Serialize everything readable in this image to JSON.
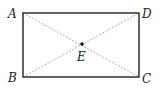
{
  "diagram": {
    "type": "rectangle-with-diagonals",
    "points": {
      "A": {
        "label": "A",
        "x": 23,
        "y": 13
      },
      "B": {
        "label": "B",
        "x": 23,
        "y": 77
      },
      "C": {
        "label": "C",
        "x": 139,
        "y": 77
      },
      "D": {
        "label": "D",
        "x": 139,
        "y": 13
      },
      "E": {
        "label": "E",
        "x": 82,
        "y": 44
      }
    },
    "edges": [
      [
        "A",
        "B"
      ],
      [
        "B",
        "C"
      ],
      [
        "C",
        "D"
      ],
      [
        "D",
        "A"
      ]
    ],
    "diagonals": [
      [
        "A",
        "C"
      ],
      [
        "B",
        "D"
      ]
    ],
    "intersection": "E",
    "colors": {
      "edge": "#222222",
      "diagonal": "#9a9a9a",
      "point": "#111111"
    }
  }
}
